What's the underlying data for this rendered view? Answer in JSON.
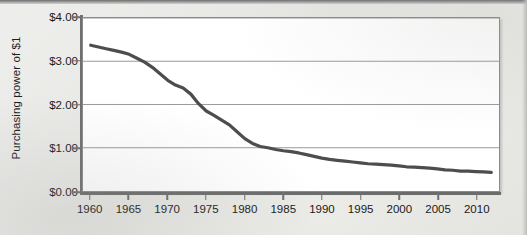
{
  "chart_data": {
    "type": "line",
    "title": "",
    "xlabel": "",
    "ylabel": "Purchasing power of $1",
    "xlim": [
      1959,
      2013
    ],
    "ylim": [
      0,
      4
    ],
    "grid": true,
    "legend": false,
    "line_color": "#4d4d4d",
    "plot_background": "#ffffff",
    "page_background": "#e9e9e7",
    "y_ticks": [
      {
        "value": 4,
        "label": "$4.00"
      },
      {
        "value": 3,
        "label": "$3.00"
      },
      {
        "value": 2,
        "label": "$2.00"
      },
      {
        "value": 1,
        "label": "$1.00"
      },
      {
        "value": 0,
        "label": "$0.00"
      }
    ],
    "x_ticks": [
      {
        "value": 1960,
        "label": "1960"
      },
      {
        "value": 1965,
        "label": "1965"
      },
      {
        "value": 1970,
        "label": "1970"
      },
      {
        "value": 1975,
        "label": "1975"
      },
      {
        "value": 1980,
        "label": "1980"
      },
      {
        "value": 1985,
        "label": "1985"
      },
      {
        "value": 1990,
        "label": "1990"
      },
      {
        "value": 1995,
        "label": "1995"
      },
      {
        "value": 2000,
        "label": "2000"
      },
      {
        "value": 2005,
        "label": "2005"
      },
      {
        "value": 2010,
        "label": "2010"
      }
    ],
    "series": [
      {
        "name": "Purchasing power of $1",
        "x": [
          1960,
          1961,
          1962,
          1963,
          1964,
          1965,
          1966,
          1967,
          1968,
          1969,
          1970,
          1971,
          1972,
          1973,
          1974,
          1975,
          1976,
          1977,
          1978,
          1979,
          1980,
          1981,
          1982,
          1983,
          1984,
          1985,
          1986,
          1987,
          1988,
          1989,
          1990,
          1991,
          1992,
          1993,
          1994,
          1995,
          1996,
          1997,
          1998,
          1999,
          2000,
          2001,
          2002,
          2003,
          2004,
          2005,
          2006,
          2007,
          2008,
          2009,
          2010,
          2011,
          2012
        ],
        "y": [
          3.37,
          3.33,
          3.29,
          3.25,
          3.21,
          3.16,
          3.07,
          2.98,
          2.86,
          2.71,
          2.56,
          2.45,
          2.38,
          2.24,
          2.02,
          1.85,
          1.75,
          1.64,
          1.53,
          1.37,
          1.21,
          1.1,
          1.03,
          1.0,
          0.96,
          0.93,
          0.91,
          0.88,
          0.84,
          0.8,
          0.76,
          0.73,
          0.71,
          0.69,
          0.67,
          0.65,
          0.63,
          0.62,
          0.61,
          0.6,
          0.58,
          0.56,
          0.55,
          0.54,
          0.53,
          0.51,
          0.49,
          0.48,
          0.46,
          0.46,
          0.45,
          0.44,
          0.43
        ]
      }
    ]
  }
}
